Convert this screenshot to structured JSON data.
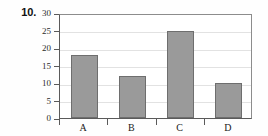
{
  "item": {
    "number_label": "10."
  },
  "chart_data": {
    "type": "bar",
    "title": "",
    "subtitle": "",
    "xlabel": "",
    "ylabel": "",
    "categories": [
      "A",
      "B",
      "C",
      "D"
    ],
    "values": [
      18,
      12,
      25,
      10
    ],
    "ylim": [
      0,
      30
    ],
    "ytick_labels": [
      "0",
      "5",
      "10",
      "15",
      "20",
      "25",
      "30"
    ],
    "ytick_values": [
      0,
      5,
      10,
      15,
      20,
      25,
      30
    ],
    "grid": true,
    "grid_axis": "y",
    "legend": false,
    "legend_position": "none",
    "annotations": []
  },
  "style": {
    "bar_fill": "#9a9a9a",
    "bar_border": "#6e6e6e",
    "axis_color": "#5a5a5a",
    "frame_color": "#8c8c8c",
    "grid_color": "#e2e2e2",
    "background": "#fefefe",
    "text_color": "#1a1a1a"
  }
}
